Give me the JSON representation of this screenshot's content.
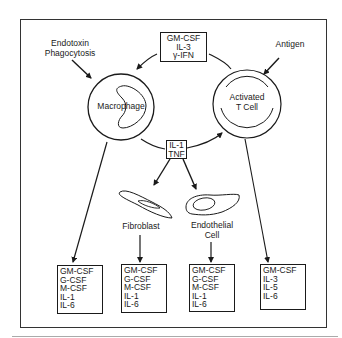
{
  "diagram": {
    "stimuli": {
      "macrophage": [
        "Endotoxin",
        "Phagocytosis"
      ],
      "tcell": "Antigen"
    },
    "cells": {
      "macrophage": "Macrophage",
      "tcell": [
        "Activated",
        "T Cell"
      ],
      "fibroblast": "Fibroblast",
      "endothelial": [
        "Endothelial",
        "Cell"
      ]
    },
    "signal_boxes": {
      "tcell_to_macrophage": [
        "GM-CSF",
        "IL-3",
        "γ-IFN"
      ],
      "macrophage_to_others": [
        "IL-1",
        "TNF"
      ]
    },
    "output_boxes": [
      {
        "source": "Macrophage",
        "items": [
          "GM-CSF",
          "G-CSF",
          "M-CSF",
          "IL-1",
          "IL-6"
        ]
      },
      {
        "source": "Fibroblast",
        "items": [
          "GM-CSF",
          "G-CSF",
          "M-CSF",
          "IL-1",
          "IL-6"
        ]
      },
      {
        "source": "Endothelial Cell",
        "items": [
          "GM-CSF",
          "G-CSF",
          "M-CSF",
          "IL-1",
          "IL-6"
        ]
      },
      {
        "source": "Activated T Cell",
        "items": [
          "GM-CSF",
          "IL-3",
          "IL-5",
          "IL-6"
        ]
      }
    ],
    "colors": {
      "ink": "#1a1a1a",
      "background": "#ffffff"
    }
  }
}
